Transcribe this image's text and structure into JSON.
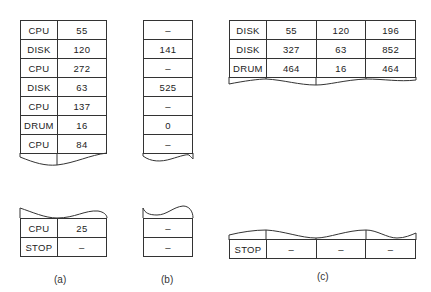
{
  "panels": {
    "a": {
      "caption": "(a)",
      "top_rows": [
        {
          "device": "CPU",
          "time": "55"
        },
        {
          "device": "DISK",
          "time": "120"
        },
        {
          "device": "CPU",
          "time": "272"
        },
        {
          "device": "DISK",
          "time": "63"
        },
        {
          "device": "CPU",
          "time": "137"
        },
        {
          "device": "DRUM",
          "time": "16"
        },
        {
          "device": "CPU",
          "time": "84"
        }
      ],
      "bottom_rows": [
        {
          "device": "CPU",
          "time": "25"
        },
        {
          "device": "STOP",
          "time": "–"
        }
      ]
    },
    "b": {
      "caption": "(b)",
      "top_rows": [
        "–",
        "141",
        "–",
        "525",
        "–",
        "0",
        "–"
      ],
      "bottom_rows": [
        "–",
        "–"
      ]
    },
    "c": {
      "caption": "(c)",
      "top_rows": [
        {
          "device": "DISK",
          "v1": "55",
          "v2": "120",
          "v3": "196"
        },
        {
          "device": "DISK",
          "v1": "327",
          "v2": "63",
          "v3": "852"
        },
        {
          "device": "DRUM",
          "v1": "464",
          "v2": "16",
          "v3": "464"
        }
      ],
      "bottom_rows": [
        {
          "device": "STOP",
          "v1": "–",
          "v2": "–",
          "v3": "–"
        }
      ]
    }
  }
}
